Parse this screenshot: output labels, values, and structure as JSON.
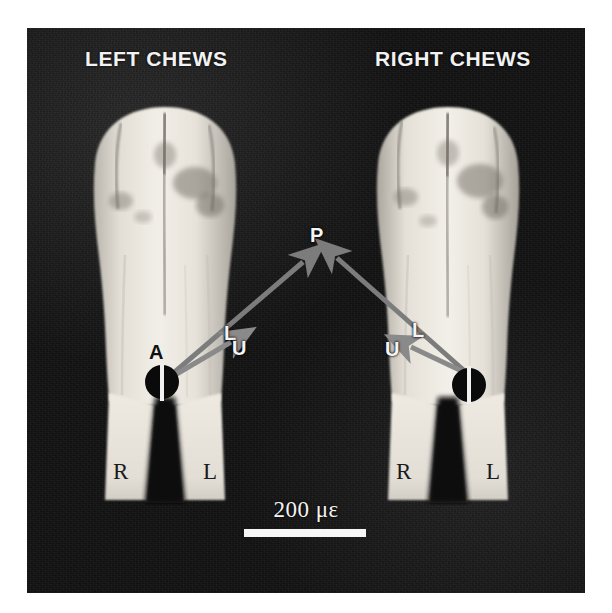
{
  "figure": {
    "panels": [
      {
        "id": "left",
        "heading": "LEFT CHEWS",
        "root_labels": {
          "right": "R",
          "left": "L"
        },
        "vector_labels": {
          "anterior": "A",
          "lateral": "L",
          "undefined": "U",
          "posterior": "P"
        }
      },
      {
        "id": "right",
        "heading": "RIGHT CHEWS",
        "root_labels": {
          "right": "R",
          "left": "L"
        },
        "vector_labels": {
          "undefined": "U",
          "lateral": "L",
          "posterior": "P"
        }
      }
    ],
    "shared_labels": {
      "posterior": "P"
    },
    "scale": {
      "value": "200",
      "unit": "με",
      "text": "200 με"
    },
    "colors": {
      "background": "#ffffff",
      "plate": "#121212",
      "arrow": "#787878",
      "label_light": "#f5f5f5",
      "label_dark": "#111111",
      "rosette": "#0a0a0a",
      "rosette_line": "#f0f0f0",
      "scale_bar": "#f6f6f6"
    }
  }
}
